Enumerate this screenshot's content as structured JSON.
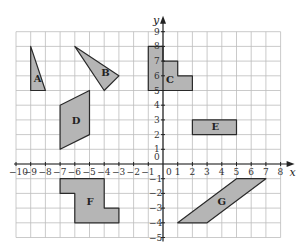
{
  "axes": {
    "x_label": "x",
    "y_label": "y",
    "x_range": [
      -10,
      8
    ],
    "y_range": [
      -5,
      9
    ],
    "origin_label": "0"
  },
  "shapes": [
    {
      "label": "A",
      "points": [
        [
          -9,
          8
        ],
        [
          -9,
          5
        ],
        [
          -8,
          5
        ]
      ],
      "label_pos": [
        -8.8,
        5.6
      ]
    },
    {
      "label": "B",
      "points": [
        [
          -6,
          8
        ],
        [
          -3,
          6
        ],
        [
          -4,
          5
        ]
      ],
      "label_pos": [
        -4.2,
        6.0
      ]
    },
    {
      "label": "C",
      "points": [
        [
          -1,
          8
        ],
        [
          0,
          8
        ],
        [
          0,
          7
        ],
        [
          1,
          7
        ],
        [
          1,
          6
        ],
        [
          2,
          6
        ],
        [
          2,
          5
        ],
        [
          -1,
          5
        ]
      ],
      "label_pos": [
        0.2,
        5.5
      ]
    },
    {
      "label": "D",
      "points": [
        [
          -7,
          4
        ],
        [
          -5,
          5
        ],
        [
          -5,
          2
        ],
        [
          -7,
          1
        ]
      ],
      "label_pos": [
        -6.2,
        2.7
      ]
    },
    {
      "label": "E",
      "points": [
        [
          2,
          3
        ],
        [
          5,
          3
        ],
        [
          5,
          2
        ],
        [
          2,
          2
        ]
      ],
      "label_pos": [
        3.3,
        2.3
      ]
    },
    {
      "label": "F",
      "points": [
        [
          -7,
          -1
        ],
        [
          -4,
          -1
        ],
        [
          -4,
          -3
        ],
        [
          -3,
          -3
        ],
        [
          -3,
          -4
        ],
        [
          -6,
          -4
        ],
        [
          -6,
          -2
        ],
        [
          -7,
          -2
        ]
      ],
      "label_pos": [
        -5.2,
        -2.8
      ]
    },
    {
      "label": "G",
      "points": [
        [
          5,
          -1
        ],
        [
          7,
          -1
        ],
        [
          3,
          -4
        ],
        [
          1,
          -4
        ]
      ],
      "label_pos": [
        3.7,
        -2.8
      ]
    }
  ],
  "colors": {
    "fill": "#b5b5b5",
    "stroke": "#2a2a2a",
    "grid": "#bdbdbd"
  }
}
